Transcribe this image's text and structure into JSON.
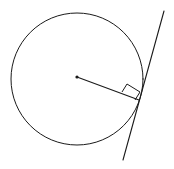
{
  "figure": {
    "title": "Circle with tangent line and radius at point of tangency",
    "background_color": "#ffffff",
    "stroke_color": "#1a1a1a",
    "width": 174,
    "height": 169
  },
  "chart_data": {
    "type": "diagram",
    "title": "Circle with tangent line and radius at point of tangency",
    "xlabel": "",
    "ylabel": "",
    "grid": false,
    "legend": false,
    "coordinate_system": "pixels, origin top-left",
    "shapes": [
      {
        "name": "circle",
        "kind": "circle",
        "center": [
          77,
          79
        ],
        "radius": 66,
        "filled": false,
        "stroke": "#1a1a1a",
        "stroke_width": 1
      },
      {
        "name": "center-dot",
        "kind": "point",
        "position": [
          77,
          77
        ],
        "radius": 1.6,
        "filled": true,
        "stroke": "#1a1a1a"
      },
      {
        "name": "radius-segment",
        "kind": "line",
        "from": [
          77,
          77
        ],
        "to": [
          139,
          100
        ],
        "stroke": "#1a1a1a",
        "stroke_width": 1.1
      },
      {
        "name": "tangent-line",
        "kind": "line",
        "from": [
          164,
          11
        ],
        "to": [
          123,
          160
        ],
        "stroke": "#1a1a1a",
        "stroke_width": 1.1
      },
      {
        "name": "right-angle-marker",
        "kind": "polyline",
        "points": [
          [
            122,
            92
          ],
          [
            127,
            84
          ],
          [
            140,
            92
          ],
          [
            135,
            100
          ]
        ],
        "closed": false,
        "stroke": "#1a1a1a",
        "stroke_width": 1
      }
    ],
    "annotations": [],
    "labels": []
  }
}
